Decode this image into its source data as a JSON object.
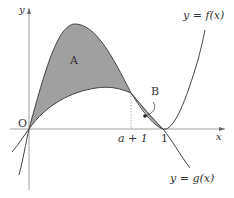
{
  "diagram": {
    "type": "function-graph-areas",
    "axes": {
      "x_label": "x",
      "y_label": "y",
      "origin_label": "O"
    },
    "curves": [
      {
        "name": "f",
        "label": "y = f(x)"
      },
      {
        "name": "g",
        "label": "y = g(x)"
      }
    ],
    "regions": [
      {
        "name": "A",
        "label": "A"
      },
      {
        "name": "B",
        "label": "B"
      }
    ],
    "x_ticks": [
      {
        "label": "a + 1"
      },
      {
        "label": "1"
      }
    ],
    "colors": {
      "fill": "#9e9e9e",
      "stroke": "#444444",
      "axis": "#777777"
    }
  }
}
